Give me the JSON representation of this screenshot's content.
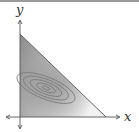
{
  "diagram": {
    "axes": {
      "x_label": "x",
      "y_label": "y"
    },
    "region": {
      "shape": "triangle",
      "vertices": [
        [
          0,
          1
        ],
        [
          0,
          0
        ],
        [
          1,
          0
        ]
      ],
      "fill": "gradient gray"
    },
    "contours": {
      "count": 5,
      "shape": "nested tilted ellipses",
      "stroke": "#7a7a7a"
    },
    "colors": {
      "axis": "#555555",
      "edge": "#666666",
      "fill_dark": "#8c8c8c",
      "fill_light": "#f2f2f2"
    }
  }
}
